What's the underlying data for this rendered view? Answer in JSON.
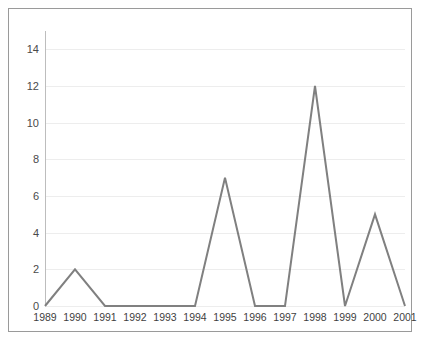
{
  "chart_data": {
    "type": "line",
    "title": "",
    "subtitle": "",
    "xlabel": "",
    "ylabel": "",
    "categories": [
      "1989",
      "1990",
      "1991",
      "1992",
      "1993",
      "1994",
      "1995",
      "1996",
      "1997",
      "1998",
      "1999",
      "2000",
      "2001"
    ],
    "values": [
      0,
      2,
      0,
      0,
      0,
      0,
      7,
      0,
      0,
      12,
      0,
      5,
      0
    ],
    "series": [
      {
        "name": "",
        "values": [
          0,
          2,
          0,
          0,
          0,
          0,
          7,
          0,
          0,
          12,
          0,
          5,
          0
        ]
      }
    ],
    "ylim": [
      0,
      15
    ],
    "ytick_values": [
      0,
      2,
      4,
      6,
      8,
      10,
      12,
      14
    ],
    "ytick_labels": [
      "0",
      "2",
      "4",
      "6",
      "8",
      "10",
      "12",
      "14"
    ],
    "grid": {
      "horizontal": true,
      "vertical": false
    },
    "legend": {
      "visible": false,
      "position": "none",
      "entries": []
    },
    "markers": false,
    "annotations": []
  },
  "style": {
    "line_color": "#808080",
    "line_width": 2,
    "grid_color": "#ededed",
    "axis_color": "#bdbdbd",
    "frame_color": "#9a9a9a",
    "background": "#ffffff",
    "tick_text_color": "#43434 3"
  }
}
